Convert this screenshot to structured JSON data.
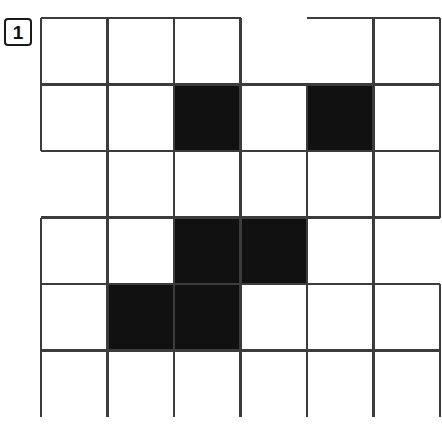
{
  "page": {
    "width": 442,
    "height": 425,
    "background": "#ffffff"
  },
  "label": {
    "text": "1",
    "name": "puzzle-number",
    "x": 4,
    "y": 18,
    "width": 28,
    "height": 28,
    "font_size": 19,
    "border_color": "#1a1a1a",
    "text_color": "#111111"
  },
  "grid": {
    "origin_x": 41,
    "origin_y": 18,
    "cell_size": 66.5,
    "cols": 6,
    "rows": 6,
    "line_color": "#3c3c3c",
    "line_width": 2.2,
    "fill_color": "#111111",
    "empty_color": "#ffffff",
    "filled_cells": [
      {
        "row": 1,
        "col": 2
      },
      {
        "row": 1,
        "col": 4
      },
      {
        "row": 3,
        "col": 2
      },
      {
        "row": 3,
        "col": 3
      },
      {
        "row": 4,
        "col": 1
      },
      {
        "row": 4,
        "col": 2
      }
    ],
    "horizontal_segments": [
      {
        "row": 0,
        "col": 0
      },
      {
        "row": 0,
        "col": 1
      },
      {
        "row": 0,
        "col": 2
      },
      {
        "row": 0,
        "col": 4
      },
      {
        "row": 0,
        "col": 5
      },
      {
        "row": 1,
        "col": 0
      },
      {
        "row": 1,
        "col": 1
      },
      {
        "row": 1,
        "col": 2
      },
      {
        "row": 1,
        "col": 3
      },
      {
        "row": 1,
        "col": 4
      },
      {
        "row": 1,
        "col": 5
      },
      {
        "row": 2,
        "col": 0
      },
      {
        "row": 2,
        "col": 1
      },
      {
        "row": 2,
        "col": 2
      },
      {
        "row": 2,
        "col": 3
      },
      {
        "row": 2,
        "col": 4
      },
      {
        "row": 2,
        "col": 5
      },
      {
        "row": 3,
        "col": 0
      },
      {
        "row": 3,
        "col": 1
      },
      {
        "row": 3,
        "col": 2
      },
      {
        "row": 3,
        "col": 3
      },
      {
        "row": 3,
        "col": 4
      },
      {
        "row": 3,
        "col": 5
      },
      {
        "row": 4,
        "col": 0
      },
      {
        "row": 4,
        "col": 1
      },
      {
        "row": 4,
        "col": 2
      },
      {
        "row": 4,
        "col": 3
      },
      {
        "row": 4,
        "col": 4
      },
      {
        "row": 4,
        "col": 5
      },
      {
        "row": 5,
        "col": 0
      },
      {
        "row": 5,
        "col": 1
      },
      {
        "row": 5,
        "col": 2
      },
      {
        "row": 5,
        "col": 3
      },
      {
        "row": 5,
        "col": 4
      },
      {
        "row": 5,
        "col": 5
      }
    ],
    "vertical_segments": [
      {
        "row": 0,
        "col": 0
      },
      {
        "row": 0,
        "col": 1
      },
      {
        "row": 0,
        "col": 2
      },
      {
        "row": 0,
        "col": 3
      },
      {
        "row": 0,
        "col": 5
      },
      {
        "row": 0,
        "col": 6
      },
      {
        "row": 1,
        "col": 0
      },
      {
        "row": 1,
        "col": 1
      },
      {
        "row": 1,
        "col": 2
      },
      {
        "row": 1,
        "col": 3
      },
      {
        "row": 1,
        "col": 4
      },
      {
        "row": 1,
        "col": 5
      },
      {
        "row": 1,
        "col": 6
      },
      {
        "row": 2,
        "col": 1
      },
      {
        "row": 2,
        "col": 2
      },
      {
        "row": 2,
        "col": 3
      },
      {
        "row": 2,
        "col": 4
      },
      {
        "row": 2,
        "col": 5
      },
      {
        "row": 2,
        "col": 6
      },
      {
        "row": 3,
        "col": 0
      },
      {
        "row": 3,
        "col": 1
      },
      {
        "row": 3,
        "col": 2
      },
      {
        "row": 3,
        "col": 3
      },
      {
        "row": 3,
        "col": 4
      },
      {
        "row": 3,
        "col": 5
      },
      {
        "row": 4,
        "col": 0
      },
      {
        "row": 4,
        "col": 1
      },
      {
        "row": 4,
        "col": 2
      },
      {
        "row": 4,
        "col": 3
      },
      {
        "row": 4,
        "col": 4
      },
      {
        "row": 4,
        "col": 5
      },
      {
        "row": 4,
        "col": 6
      },
      {
        "row": 5,
        "col": 0
      },
      {
        "row": 5,
        "col": 1
      },
      {
        "row": 5,
        "col": 2
      },
      {
        "row": 5,
        "col": 3
      },
      {
        "row": 5,
        "col": 4
      },
      {
        "row": 5,
        "col": 5
      },
      {
        "row": 5,
        "col": 6
      }
    ]
  }
}
